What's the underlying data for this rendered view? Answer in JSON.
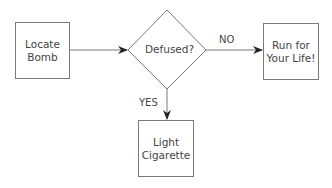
{
  "flowchart": {
    "nodes": [
      {
        "id": "locate",
        "shape": "rectangle",
        "label": "Locate\nBomb"
      },
      {
        "id": "defused",
        "shape": "diamond",
        "label": "Defused?"
      },
      {
        "id": "run",
        "shape": "rectangle",
        "label": "Run for\nYour Life!"
      },
      {
        "id": "light",
        "shape": "rectangle",
        "label": "Light\nCigarette"
      }
    ],
    "edges": [
      {
        "from": "locate",
        "to": "defused",
        "label": ""
      },
      {
        "from": "defused",
        "to": "run",
        "label": "NO"
      },
      {
        "from": "defused",
        "to": "light",
        "label": "YES"
      }
    ]
  },
  "labels": {
    "locate_1": "Locate",
    "locate_2": "Bomb",
    "defused": "Defused?",
    "run_1": "Run for",
    "run_2": "Your Life!",
    "light_1": "Light",
    "light_2": "Cigarette",
    "no": "NO",
    "yes": "YES"
  },
  "colors": {
    "stroke": "#7a7a7a",
    "text": "#444444",
    "arrow": "#222222"
  }
}
